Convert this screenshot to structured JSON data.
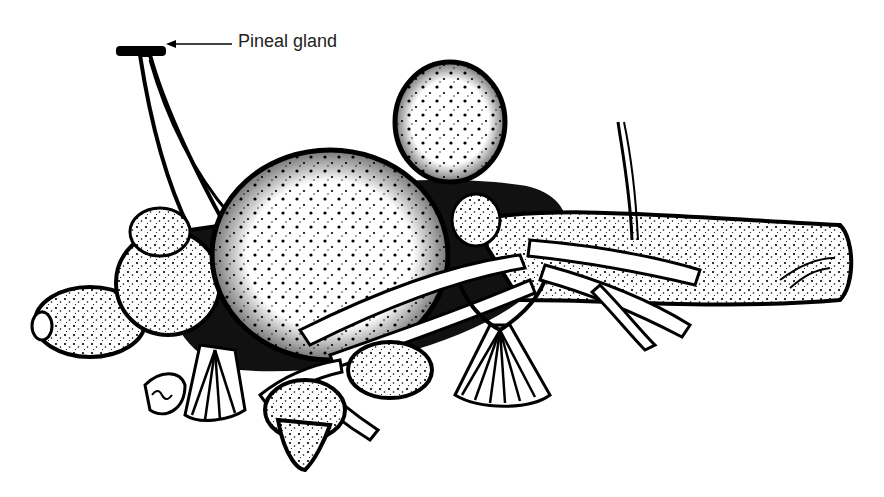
{
  "figure": {
    "annotations": [
      {
        "label": "Pineal gland",
        "pointer": "arrow-left"
      }
    ]
  },
  "colors": {
    "ink": "#000000",
    "background": "#ffffff",
    "label_text": "#222222"
  }
}
